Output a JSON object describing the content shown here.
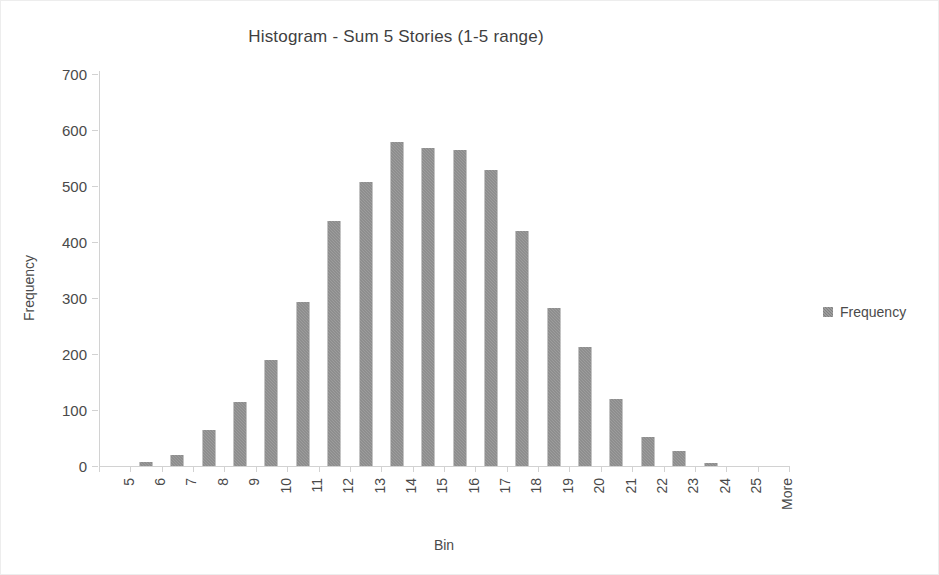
{
  "chart_data": {
    "type": "bar",
    "title": "Histogram - Sum 5 Stories (1-5 range)",
    "xlabel": "Bin",
    "ylabel": "Frequency",
    "categories": [
      "5",
      "6",
      "7",
      "8",
      "9",
      "10",
      "11",
      "12",
      "13",
      "14",
      "15",
      "16",
      "17",
      "18",
      "19",
      "20",
      "21",
      "22",
      "23",
      "24",
      "25",
      "More"
    ],
    "values": [
      0,
      8,
      20,
      65,
      115,
      190,
      293,
      437,
      507,
      578,
      567,
      565,
      528,
      420,
      282,
      213,
      120,
      52,
      27,
      5,
      0,
      0
    ],
    "series": [
      {
        "name": "Frequency",
        "values": [
          0,
          8,
          20,
          65,
          115,
          190,
          293,
          437,
          507,
          578,
          567,
          565,
          528,
          420,
          282,
          213,
          120,
          52,
          27,
          5,
          0,
          0
        ]
      }
    ],
    "ylim": [
      0,
      700
    ],
    "yticks": [
      0,
      100,
      200,
      300,
      400,
      500,
      600,
      700
    ],
    "ytick_labels": [
      "0",
      "100",
      "200",
      "300",
      "400",
      "500",
      "600",
      "700"
    ],
    "grid": false,
    "legend": {
      "position": "right",
      "entries": [
        "Frequency"
      ]
    },
    "colors": {
      "bar": "#808080",
      "axis": "#d2d2d2",
      "text": "#4a4a4a",
      "title": "#3f3f3f",
      "background": "#ffffff",
      "border": "#ededed"
    }
  }
}
